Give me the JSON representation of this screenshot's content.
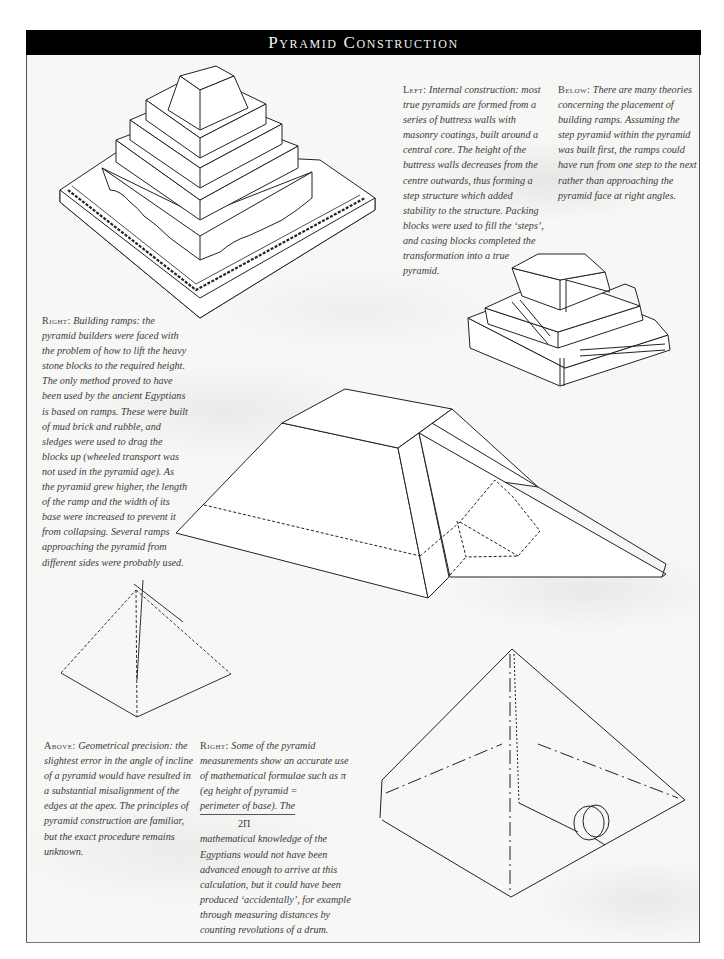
{
  "header": {
    "title": "Pyramid Construction"
  },
  "captions": {
    "left_internal": {
      "lead": "Left:",
      "text": " Internal construction: most true pyramids are formed from a series of buttress walls with masonry coatings, built around a central core. The height of the buttress walls decreases from the centre outwards, thus forming a step structure which added stability to the structure. Packing blocks were used to fill the ‘steps’, and casing blocks completed the transformation into a true pyramid."
    },
    "below_ramps": {
      "lead": "Below:",
      "text": " There are many theories concerning the placement of building ramps. Assuming the step pyramid within the pyramid was built first, the ramps could have run from one step to the next rather than approaching the pyramid face at right angles."
    },
    "right_ramps": {
      "lead": "Right:",
      "text": " Building ramps: the pyramid builders were faced with the problem of how to lift the heavy stone blocks to the required height. The only method proved to have been used by the ancient Egyptians is based on ramps. These were built of mud brick and rubble, and sledges were used to drag the blocks up (wheeled transport was not used in the pyramid age). As the pyramid grew higher, the length of the ramp and the width of its base were increased to prevent it from collapsing. Several ramps approaching the pyramid from different sides were probably used."
    },
    "above_precision": {
      "lead": "Above:",
      "text": " Geometrical precision: the slightest error in the angle of incline of a pyramid would have resulted in a substantial misalignment of the edges at the apex. The principles of pyramid construction are familiar, but the exact procedure remains unknown."
    },
    "right_math": {
      "lead": "Right:",
      "text_before": " Some of the pyramid measurements show an accurate use of mathematical formulae such as π (eg height of pyramid =",
      "formula_numerator": "perimeter of base). The",
      "formula_denominator": "2Π",
      "text_after": "mathematical knowledge of the Egyptians would not have been advanced enough to arrive at this calculation, but it could have been produced ‘accidentally’, for example through measuring distances by counting revolutions of a drum."
    }
  },
  "illustrations": {
    "step_pyramid_core": "internal-construction-diagram",
    "stepped_ramps": "stepped-ramp-diagram",
    "straight_ramp": "building-ramp-diagram",
    "precision_pyramid": "geometric-precision-diagram",
    "drum_pyramid": "drum-measurement-diagram"
  },
  "colors": {
    "header_bg": "#000000",
    "header_text": "#f2f2f2",
    "line": "#222222",
    "caption_text": "#3a3a3a"
  }
}
